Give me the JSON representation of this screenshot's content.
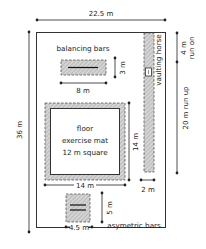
{
  "diagram": {
    "colors": {
      "line": "#222222",
      "hatch": "#b8b8b8",
      "hatch_bg": "#d6d6d6",
      "background": "#ffffff"
    },
    "dimensions": {
      "hall_width": "22.5 m",
      "hall_length": "36 m",
      "run_on": "4 m",
      "run_on_label": "run on",
      "run_up": "20 m run up",
      "beam_depth": "3 m",
      "beam_width": "8 m",
      "mat_side_vertical": "14 m",
      "mat_side_horizontal": "14 m",
      "runway_width": "2 m",
      "bars_depth": "5 m",
      "bars_width": "4.5 m"
    },
    "apparatus": {
      "balancing_bars": "balancing bars",
      "vaulting_horse": "vaulting horse",
      "floor_mat_line1": "floor",
      "floor_mat_line2": "exercise mat",
      "floor_mat_line3": "12 m square",
      "asymmetric_bars": "asymetric bars"
    }
  }
}
